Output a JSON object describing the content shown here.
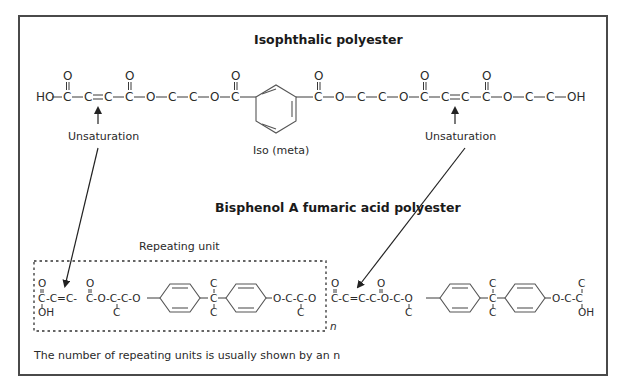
{
  "figure": {
    "top_section": {
      "title": "Isophthalic polyester",
      "chain_atoms": [
        "HO",
        "C",
        "C",
        "C",
        "C",
        "O",
        "C",
        "C",
        "O",
        "C",
        "C",
        "O",
        "C",
        "C",
        "O",
        "C",
        "C",
        "C",
        "C",
        "O",
        "C",
        "C",
        "OH"
      ],
      "carbonyl_o": "O",
      "ring_label": "Iso (meta)",
      "unsaturation_left": "Unsaturation",
      "unsaturation_right": "Unsaturation"
    },
    "bottom_section": {
      "title": "Bisphenol A fumaric acid polyester",
      "repeating_unit_label": "Repeating unit",
      "repeat_subscript": "n",
      "oh_left": "OH",
      "oh_right": "OH",
      "methyl": "C",
      "footnote": "The number of repeating units is usually shown by an n"
    }
  }
}
